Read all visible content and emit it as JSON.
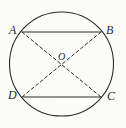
{
  "figure": {
    "type": "geometry-diagram",
    "background_color": "#fbfbf9",
    "stroke_color": "#2b2b2b",
    "canvas": {
      "width": 126,
      "height": 128
    },
    "circle": {
      "name": "circumscribed-circle",
      "center_x": 61.5,
      "center_y": 64,
      "radius": 52,
      "stroke_width": 1.1,
      "style": "solid"
    },
    "center_point": {
      "label": "O",
      "x": 61.5,
      "y": 64
    },
    "vertices": [
      {
        "label": "A",
        "x": 22,
        "y": 32,
        "position": "top-left"
      },
      {
        "label": "B",
        "x": 101,
        "y": 32,
        "position": "top-right"
      },
      {
        "label": "C",
        "x": 101,
        "y": 97,
        "position": "bottom-right"
      },
      {
        "label": "D",
        "x": 22,
        "y": 97,
        "position": "bottom-left"
      }
    ],
    "solid_chords": [
      {
        "name": "chord-AB",
        "from": "A",
        "to": "B",
        "x1": 22,
        "y1": 32,
        "x2": 101,
        "y2": 32
      },
      {
        "name": "chord-DC",
        "from": "D",
        "to": "C",
        "x1": 22,
        "y1": 97,
        "x2": 101,
        "y2": 97
      }
    ],
    "dashed_diagonals": [
      {
        "name": "diagonal-AC",
        "from": "A",
        "to": "C",
        "x1": 22,
        "y1": 32,
        "x2": 101,
        "y2": 97
      },
      {
        "name": "diagonal-BD",
        "from": "B",
        "to": "D",
        "x1": 101,
        "y1": 32,
        "x2": 22,
        "y2": 97
      }
    ],
    "dash_pattern": "3.2 2.6",
    "line_stroke_width": 1.0
  }
}
